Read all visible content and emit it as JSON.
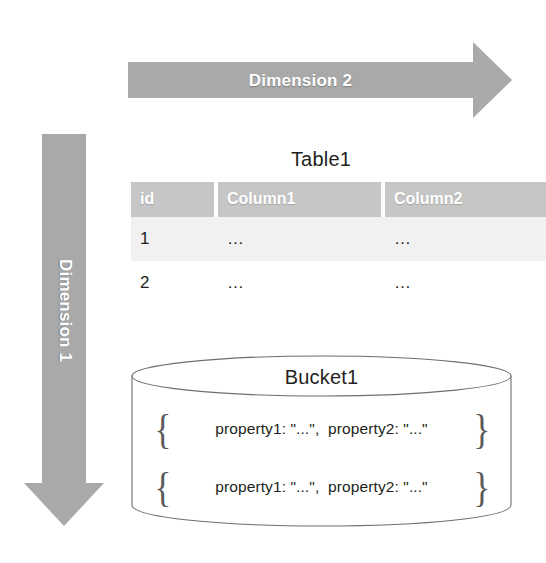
{
  "diagram": {
    "background_color": "#ffffff",
    "arrow_color": "#a9a9a9",
    "header_color": "#c6c6c6",
    "stripe_color": "#f1f1f1",
    "text_color": "#231f20"
  },
  "arrows": {
    "horizontal": {
      "label": "Dimension 2",
      "direction": "right"
    },
    "vertical": {
      "label": "Dimension 1",
      "direction": "down"
    }
  },
  "table": {
    "title": "Table1",
    "columns": [
      "id",
      "Column1",
      "Column2"
    ],
    "rows": [
      {
        "id": "1",
        "column1": "…",
        "column2": "…"
      },
      {
        "id": "2",
        "column1": "…",
        "column2": "…"
      }
    ]
  },
  "bucket": {
    "title": "Bucket1",
    "brace_open": "{",
    "brace_close": "}",
    "documents": [
      {
        "text": "property1: \"...\",  property2: \"...\""
      },
      {
        "text": "property1: \"...\",  property2: \"...\""
      }
    ]
  }
}
